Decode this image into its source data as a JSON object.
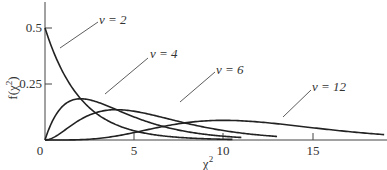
{
  "chart_data": {
    "type": "line",
    "title": "",
    "xlabel": "χ²",
    "ylabel": "f(χ²)",
    "xlim": [
      0,
      19
    ],
    "ylim": [
      0,
      0.6
    ],
    "grid": false,
    "legend": "inline leader-line labels",
    "x_ticks": [
      {
        "value": 0,
        "label": "0"
      },
      {
        "value": 5,
        "label": "5"
      },
      {
        "value": 10,
        "label": "10"
      },
      {
        "value": 15,
        "label": "15"
      }
    ],
    "y_ticks": [
      {
        "value": 0.25,
        "label": "0.25"
      },
      {
        "value": 0.5,
        "label": "0.5"
      }
    ],
    "series": [
      {
        "name": "ν = 2",
        "label": "ν = 2",
        "dof": 2,
        "x_end": 10.5,
        "x": [
          0,
          1,
          2,
          3,
          4,
          5,
          6,
          7,
          8,
          9,
          10,
          10.5
        ],
        "values": [
          0.5,
          0.303,
          0.184,
          0.112,
          0.068,
          0.041,
          0.025,
          0.015,
          0.009,
          0.006,
          0.003,
          0.003
        ]
      },
      {
        "name": "ν = 4",
        "label": "ν = 4",
        "dof": 4,
        "x_end": 11,
        "x": [
          0,
          1,
          2,
          3,
          4,
          5,
          6,
          7,
          8,
          9,
          10,
          11
        ],
        "values": [
          0,
          0.152,
          0.184,
          0.167,
          0.135,
          0.103,
          0.075,
          0.053,
          0.037,
          0.025,
          0.017,
          0.011
        ]
      },
      {
        "name": "ν = 6",
        "label": "ν = 6",
        "dof": 6,
        "x_end": 13,
        "x": [
          0,
          1,
          2,
          3,
          4,
          5,
          6,
          7,
          8,
          9,
          10,
          11,
          12,
          13
        ],
        "values": [
          0,
          0.038,
          0.092,
          0.126,
          0.135,
          0.128,
          0.112,
          0.092,
          0.073,
          0.056,
          0.042,
          0.031,
          0.022,
          0.016
        ]
      },
      {
        "name": "ν = 12",
        "label": "ν = 12",
        "dof": 12,
        "x_end": 19,
        "x": [
          0,
          2,
          4,
          6,
          8,
          10,
          12,
          14,
          16,
          18,
          19
        ],
        "values": [
          0,
          0.003,
          0.034,
          0.077,
          0.104,
          0.104,
          0.088,
          0.065,
          0.044,
          0.027,
          0.021
        ]
      }
    ]
  },
  "labels": {
    "ylabel_main": "f(χ",
    "ylabel_sup": "2",
    "ylabel_close": ")",
    "xlabel_main": "χ",
    "xlabel_sup": "2",
    "origin": "0",
    "xtick_5": "5",
    "xtick_10": "10",
    "xtick_15": "15",
    "ytick_025": "0.25",
    "ytick_05": "0.5",
    "nu2": "ν = 2",
    "nu4": "ν = 4",
    "nu6": "ν = 6",
    "nu12": "ν = 12"
  }
}
